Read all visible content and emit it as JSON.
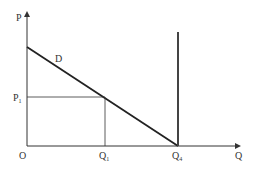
{
  "diagram": {
    "axis_labels": {
      "y": "P",
      "x": "Q",
      "origin": "O"
    },
    "curve_label": "D",
    "price_label": {
      "base": "P",
      "sub": "1"
    },
    "quantity_label": {
      "base": "Q",
      "sub": "1"
    },
    "supply_quantity_label": {
      "base": "Q",
      "sub": "4"
    },
    "colors": {
      "line": "#222222",
      "axis": "#333333"
    }
  }
}
